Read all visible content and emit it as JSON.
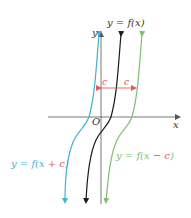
{
  "graph": {
    "axes": {
      "x_label": "x",
      "y_label": "y",
      "origin_label": "O"
    },
    "curves": [
      {
        "name": "original",
        "label": "y = f(x)",
        "color": "#1a1a1a"
      },
      {
        "name": "shift-left",
        "label_parts": [
          "y = f(x ",
          "+ c",
          ")"
        ],
        "color": "#3fb0d8"
      },
      {
        "name": "shift-right",
        "label_parts": [
          "y = f(x ",
          "− c",
          ")"
        ],
        "color": "#7cc06e"
      }
    ],
    "shift": {
      "label_left": "c",
      "label_right": "c",
      "color": "#e35d5d"
    },
    "colors": {
      "axis": "#555555",
      "shift_text": "#d9534f"
    }
  }
}
